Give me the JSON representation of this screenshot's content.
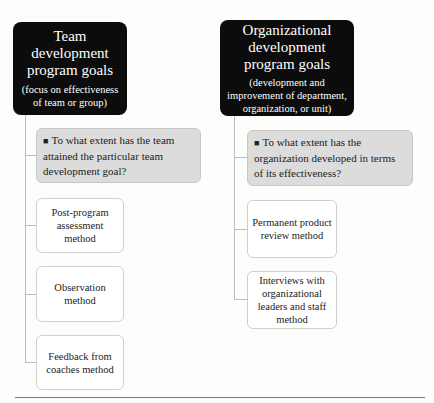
{
  "left": {
    "header_title": "Team development program goals",
    "header_subtitle": "(focus on effectiveness of team or group)",
    "question": "To what extent has the team attained the particular team development goal?",
    "methods": [
      "Post-program assessment method",
      "Observation method",
      "Feedback from coaches method"
    ]
  },
  "right": {
    "header_title": "Organizational development program goals",
    "header_subtitle": "(development and improvement of department, organization, or unit)",
    "question": "To what extent has the organization developed in terms of its effectiveness?",
    "methods": [
      "Permanent product review method",
      "Interviews with organizational leaders and staff method"
    ]
  },
  "bullet": "■"
}
